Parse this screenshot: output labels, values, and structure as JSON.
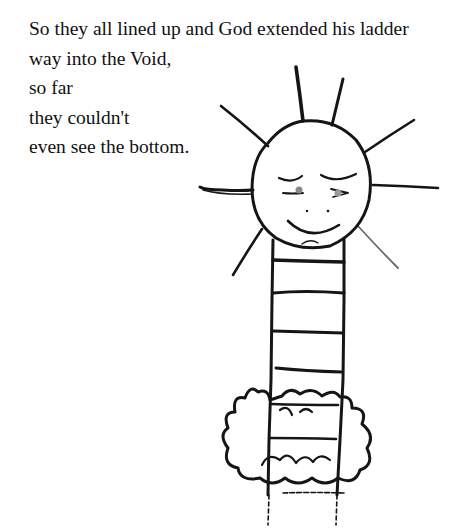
{
  "story": {
    "lines": [
      "So they all lined up and God extended his ladder",
      "way into the Void,",
      "so far",
      "they couldn't",
      "even see the bottom."
    ]
  },
  "illustration": {
    "subject": "child's drawing of a smiling sun-like face atop a ladder passing through a cloud",
    "ink_color": "#151515",
    "shade_color": "#8a8a8a",
    "background": "#ffffff"
  }
}
